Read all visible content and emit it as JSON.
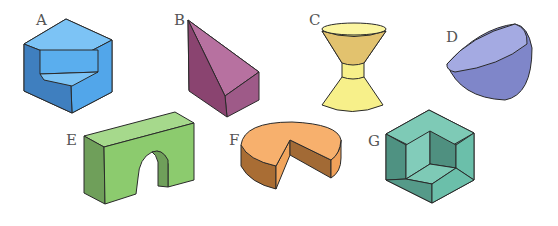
{
  "figure": {
    "shapes": [
      {
        "label": "A",
        "name": "hexagonal block with notch",
        "color": "#5aaeee"
      },
      {
        "label": "B",
        "name": "wedge pyramid prism",
        "color": "#a8608f"
      },
      {
        "label": "C",
        "name": "double frustum hourglass",
        "color": "#f7f08a"
      },
      {
        "label": "D",
        "name": "hemisphere bowl",
        "color": "#8b91d2"
      },
      {
        "label": "E",
        "name": "arch block",
        "color": "#8ccb6e"
      },
      {
        "label": "F",
        "name": "cylinder with wedge cut",
        "color": "#f4a65e"
      },
      {
        "label": "G",
        "name": "cube with corner cut out",
        "color": "#6bbfaa"
      }
    ]
  }
}
